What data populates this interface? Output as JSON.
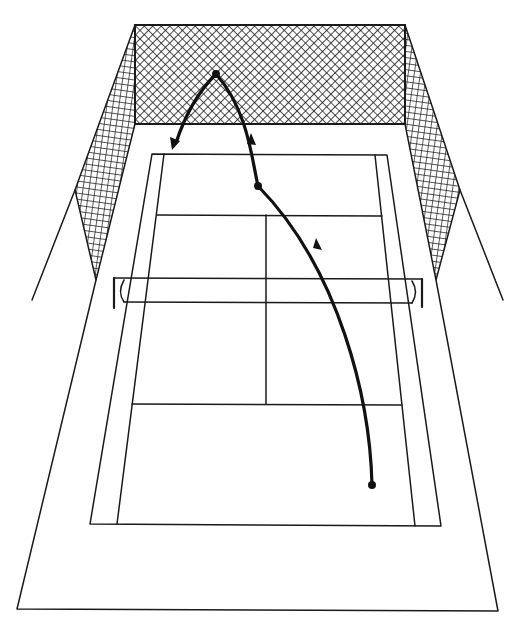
{
  "diagram": {
    "title": "Tennis lob shot trajectory onto back netting",
    "colors": {
      "ink": "#1a1a1a",
      "background": "#ffffff"
    },
    "elements": {
      "surround": "outer court surround",
      "back_net": "back fence netting",
      "side_net_left": "left side fence netting",
      "side_net_right": "right side fence netting",
      "doubles_court": "doubles court outline",
      "singles_lines": "singles sidelines",
      "service_lines": "service lines",
      "center_line": "center service line",
      "tennis_net": "tennis net with posts",
      "ball_path": "ball trajectory"
    },
    "trajectory": {
      "start": {
        "x": 372,
        "y": 485,
        "label": "hit point"
      },
      "bounce": {
        "x": 258,
        "y": 186,
        "label": "bounce point"
      },
      "apex": {
        "x": 216,
        "y": 74,
        "label": "net contact point"
      },
      "end": {
        "x": 174,
        "y": 148,
        "label": "rebound end"
      }
    }
  }
}
